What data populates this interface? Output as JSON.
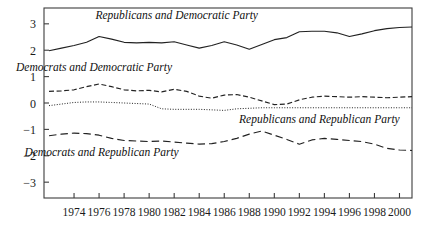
{
  "chart_data": {
    "type": "line",
    "title": "",
    "xlabel": "",
    "ylabel": "",
    "xlim": [
      1971.6,
      2001.0
    ],
    "ylim": [
      -3.6,
      3.6
    ],
    "grid": false,
    "legend_position": "inline-annotations",
    "x_tick_labels": [
      "1974",
      "1976",
      "1978",
      "1980",
      "1982",
      "1984",
      "1986",
      "1988",
      "1990",
      "1992",
      "1994",
      "1996",
      "1998",
      "2000"
    ],
    "x_ticks": [
      1974,
      1976,
      1978,
      1980,
      1982,
      1984,
      1986,
      1988,
      1990,
      1992,
      1994,
      1996,
      1998,
      2000
    ],
    "y_tick_labels": [
      "3",
      "2",
      "1",
      "0",
      "−1",
      "−2",
      "−3"
    ],
    "y_ticks": [
      3,
      2,
      1,
      0,
      -1,
      -2,
      -3
    ],
    "x": [
      1972,
      1973,
      1974,
      1975,
      1976,
      1977,
      1978,
      1979,
      1980,
      1981,
      1982,
      1983,
      1984,
      1985,
      1986,
      1987,
      1988,
      1989,
      1990,
      1991,
      1992,
      1993,
      1994,
      1995,
      1996,
      1997,
      1998,
      1999,
      2000,
      2001
    ],
    "series": [
      {
        "name": "Republicans and Democratic Party",
        "style": "solid",
        "label_x": 1982.2,
        "label_y": 3.18,
        "values": [
          1.98,
          2.08,
          2.18,
          2.3,
          2.52,
          2.42,
          2.3,
          2.28,
          2.3,
          2.28,
          2.32,
          2.2,
          2.08,
          2.18,
          2.32,
          2.2,
          2.04,
          2.22,
          2.4,
          2.48,
          2.7,
          2.72,
          2.72,
          2.66,
          2.52,
          2.62,
          2.74,
          2.82,
          2.86,
          2.88
        ]
      },
      {
        "name": "Democrats and Democratic Party",
        "style": "dashed",
        "label_x": 1975.6,
        "label_y": 1.22,
        "values": [
          0.44,
          0.46,
          0.5,
          0.62,
          0.72,
          0.62,
          0.5,
          0.46,
          0.48,
          0.42,
          0.52,
          0.44,
          0.26,
          0.18,
          0.3,
          0.32,
          0.22,
          0.08,
          -0.06,
          -0.04,
          0.12,
          0.22,
          0.26,
          0.24,
          0.22,
          0.24,
          0.22,
          0.2,
          0.22,
          0.24
        ]
      },
      {
        "name": "Republicans and Republican Party",
        "style": "dotted",
        "label_x": 1993.6,
        "label_y": -0.74,
        "values": [
          -0.1,
          -0.04,
          0.02,
          0.04,
          0.04,
          0.02,
          0.0,
          -0.02,
          -0.04,
          -0.22,
          -0.24,
          -0.24,
          -0.24,
          -0.26,
          -0.28,
          -0.22,
          -0.2,
          -0.18,
          -0.18,
          -0.18,
          -0.18,
          -0.18,
          -0.18,
          -0.18,
          -0.18,
          -0.18,
          -0.18,
          -0.18,
          -0.18,
          -0.18
        ]
      },
      {
        "name": "Democrats and Republican Party",
        "style": "long-dashed",
        "label_x": 1976.2,
        "label_y": -2.02,
        "values": [
          -1.24,
          -1.18,
          -1.14,
          -1.16,
          -1.22,
          -1.34,
          -1.42,
          -1.44,
          -1.46,
          -1.44,
          -1.48,
          -1.52,
          -1.56,
          -1.54,
          -1.46,
          -1.34,
          -1.18,
          -1.06,
          -1.22,
          -1.38,
          -1.56,
          -1.4,
          -1.34,
          -1.38,
          -1.42,
          -1.46,
          -1.56,
          -1.72,
          -1.78,
          -1.8
        ]
      }
    ]
  },
  "colors": {
    "axis": "#3d3d3d",
    "line": "#222222",
    "background": "#ffffff"
  }
}
